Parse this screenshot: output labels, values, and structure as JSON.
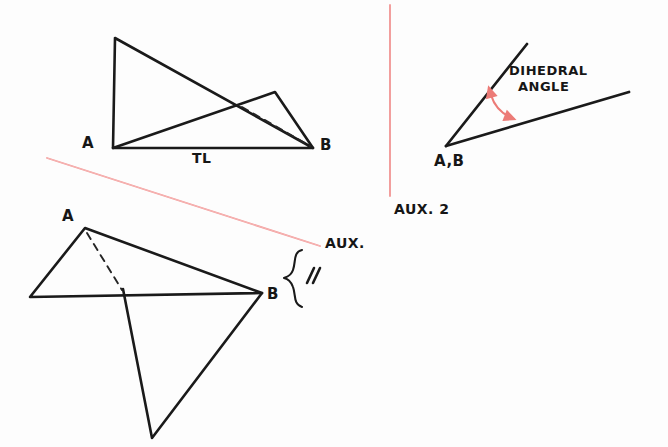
{
  "page": {
    "background_color": "#fdfdfd",
    "ink_color": "#1a1a1a",
    "red_color": "#f08a8a",
    "red_dark_color": "#e8736f"
  },
  "figures": {
    "top_left": {
      "name": "Top View / Front View with True Length edge",
      "labels": {
        "point_a": "A",
        "point_b": "B",
        "true_length": "TL"
      },
      "geometry": {
        "apex": [
          115,
          38
        ],
        "point_a": [
          113,
          148
        ],
        "point_b": [
          313,
          148
        ],
        "ridge": [
          275,
          92
        ],
        "hidden_edge_from": [
          240,
          110
        ],
        "hidden_edge_to": [
          311,
          146
        ]
      }
    },
    "bottom_left": {
      "name": "Auxiliary View Projection",
      "labels": {
        "point_a": "A",
        "point_b": "B",
        "aux": "AUX."
      },
      "geometry": {
        "point_a": [
          85,
          228
        ],
        "point_b": [
          262,
          293
        ],
        "left_vertex": [
          30,
          297
        ],
        "bottom_vertex": [
          152,
          438
        ],
        "hidden_edge_from": [
          87,
          232
        ],
        "hidden_edge_to": [
          124,
          292
        ]
      }
    },
    "right": {
      "name": "Auxiliary View 2 showing True Dihedral Angle",
      "labels": {
        "vertex": "A,B",
        "angle_line1": "DIHEDRAL",
        "angle_line2": "ANGLE",
        "view": "AUX. 2"
      },
      "geometry": {
        "vertex": [
          446,
          146
        ],
        "ray_up_end": [
          527,
          44
        ],
        "ray_right_end": [
          628,
          92
        ],
        "arc_start": [
          489,
          93
        ],
        "arc_end": [
          516,
          119
        ]
      }
    }
  },
  "annotations": {
    "fold_line_aux_label": "AUX.",
    "fold_line_aux2_label": "AUX. 2",
    "tick_marks": "//",
    "brace": "}",
    "transfer_distance_note": "equal-distance tick marks"
  }
}
